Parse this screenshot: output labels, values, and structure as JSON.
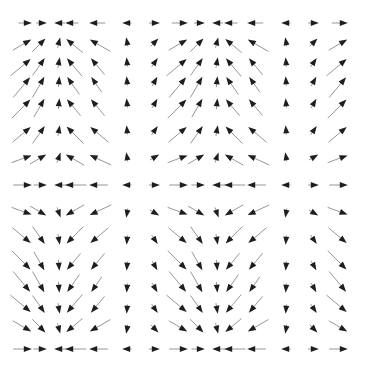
{
  "chart_data": {
    "type": "quiver",
    "title": "",
    "xlabel": "",
    "ylabel": "",
    "grid": false,
    "legend": null,
    "x_pixels": [
      27,
      42,
      59,
      70,
      94,
      127,
      155,
      183,
      200,
      217,
      229,
      252,
      286,
      314,
      343
    ],
    "y_pixels": [
      23,
      42,
      62,
      81,
      103,
      130,
      157,
      185,
      213,
      240,
      266,
      288,
      309,
      329,
      349
    ],
    "angles_deg_rows": [
      [
        0,
        0,
        180,
        180,
        180,
        180,
        0,
        0,
        0,
        180,
        180,
        180,
        180,
        0,
        0
      ],
      [
        30,
        45,
        75,
        140,
        150,
        100,
        45,
        30,
        45,
        75,
        140,
        150,
        100,
        45,
        30
      ],
      [
        40,
        55,
        80,
        130,
        130,
        95,
        55,
        40,
        55,
        80,
        130,
        130,
        95,
        55,
        40
      ],
      [
        50,
        60,
        85,
        125,
        125,
        95,
        60,
        50,
        60,
        85,
        125,
        125,
        95,
        60,
        50
      ],
      [
        45,
        60,
        85,
        130,
        130,
        95,
        60,
        45,
        60,
        85,
        130,
        130,
        95,
        60,
        45
      ],
      [
        40,
        55,
        80,
        135,
        140,
        95,
        55,
        40,
        55,
        80,
        135,
        140,
        95,
        55,
        40
      ],
      [
        20,
        30,
        70,
        150,
        155,
        100,
        30,
        20,
        30,
        70,
        150,
        155,
        100,
        30,
        20
      ],
      [
        0,
        0,
        180,
        180,
        180,
        180,
        0,
        0,
        0,
        180,
        180,
        180,
        180,
        0,
        0
      ],
      [
        -20,
        -30,
        -70,
        -150,
        -155,
        -100,
        -30,
        -20,
        -30,
        -70,
        -150,
        -155,
        -100,
        -30,
        -20
      ],
      [
        -40,
        -55,
        -80,
        -135,
        -140,
        -95,
        -55,
        -40,
        -55,
        -80,
        -135,
        -140,
        -95,
        -55,
        -40
      ],
      [
        -45,
        -60,
        -85,
        -130,
        -130,
        -95,
        -60,
        -45,
        -60,
        -85,
        -130,
        -130,
        -95,
        -60,
        -45
      ],
      [
        -50,
        -60,
        -85,
        -125,
        -125,
        -95,
        -60,
        -50,
        -60,
        -85,
        -125,
        -125,
        -95,
        -60,
        -50
      ],
      [
        -40,
        -55,
        -80,
        -130,
        -130,
        -95,
        -55,
        -40,
        -55,
        -80,
        -130,
        -130,
        -95,
        -55,
        -40
      ],
      [
        -30,
        -45,
        -75,
        -140,
        -150,
        -100,
        -45,
        -30,
        -45,
        -75,
        -140,
        -150,
        -100,
        -45,
        -30
      ],
      [
        0,
        0,
        180,
        180,
        180,
        180,
        0,
        0,
        0,
        180,
        180,
        180,
        180,
        0,
        0
      ]
    ],
    "magnitude_rows": [
      [
        0.5,
        0.4,
        0.4,
        0.5,
        0.6,
        0.3,
        0.4,
        0.6,
        0.4,
        0.4,
        0.5,
        0.6,
        0.3,
        0.4,
        0.6
      ],
      [
        0.8,
        0.7,
        0.4,
        0.8,
        0.9,
        0.3,
        0.4,
        0.8,
        0.7,
        0.4,
        0.8,
        0.9,
        0.3,
        0.4,
        0.8
      ],
      [
        1.0,
        0.8,
        0.4,
        0.9,
        0.8,
        0.3,
        0.4,
        1.0,
        0.8,
        0.4,
        0.9,
        0.8,
        0.3,
        0.4,
        1.0
      ],
      [
        1.0,
        0.9,
        0.4,
        0.8,
        0.7,
        0.3,
        0.4,
        1.0,
        0.9,
        0.4,
        0.8,
        0.7,
        0.3,
        0.4,
        1.0
      ],
      [
        1.0,
        0.8,
        0.4,
        0.8,
        0.8,
        0.3,
        0.4,
        1.0,
        0.8,
        0.4,
        0.8,
        0.8,
        0.3,
        0.4,
        1.0
      ],
      [
        0.9,
        0.8,
        0.4,
        0.9,
        0.9,
        0.3,
        0.4,
        0.9,
        0.8,
        0.4,
        0.9,
        0.9,
        0.3,
        0.4,
        0.9
      ],
      [
        0.8,
        0.7,
        0.4,
        0.8,
        0.9,
        0.3,
        0.4,
        0.8,
        0.7,
        0.4,
        0.8,
        0.9,
        0.3,
        0.4,
        0.8
      ],
      [
        0.7,
        0.5,
        0.5,
        0.8,
        0.7,
        0.3,
        0.4,
        0.7,
        0.5,
        0.5,
        0.8,
        0.7,
        0.3,
        0.4,
        0.7
      ],
      [
        0.8,
        0.7,
        0.4,
        0.8,
        0.9,
        0.3,
        0.4,
        0.8,
        0.7,
        0.4,
        0.8,
        0.9,
        0.3,
        0.4,
        0.8
      ],
      [
        0.9,
        0.8,
        0.4,
        0.9,
        0.9,
        0.3,
        0.4,
        0.9,
        0.8,
        0.4,
        0.9,
        0.9,
        0.3,
        0.4,
        0.9
      ],
      [
        1.0,
        0.8,
        0.4,
        0.8,
        0.8,
        0.3,
        0.4,
        1.0,
        0.8,
        0.4,
        0.8,
        0.8,
        0.3,
        0.4,
        1.0
      ],
      [
        1.0,
        0.9,
        0.4,
        0.8,
        0.7,
        0.3,
        0.4,
        1.0,
        0.9,
        0.4,
        0.8,
        0.7,
        0.3,
        0.4,
        1.0
      ],
      [
        1.0,
        0.8,
        0.4,
        0.9,
        0.8,
        0.3,
        0.4,
        1.0,
        0.8,
        0.4,
        0.9,
        0.8,
        0.3,
        0.4,
        1.0
      ],
      [
        0.8,
        0.7,
        0.4,
        0.8,
        0.9,
        0.3,
        0.4,
        0.8,
        0.7,
        0.4,
        0.8,
        0.9,
        0.3,
        0.4,
        0.8
      ],
      [
        0.7,
        0.5,
        0.5,
        0.8,
        0.7,
        0.3,
        0.4,
        0.7,
        0.5,
        0.5,
        0.8,
        0.7,
        0.3,
        0.4,
        0.7
      ]
    ],
    "arrow_style": {
      "head_color": "#1e1e1e",
      "shaft_color": "#8a8a8a",
      "max_length_px": 26,
      "head_length_px": 8,
      "head_width_px": 6
    },
    "notes_visible_text": []
  }
}
